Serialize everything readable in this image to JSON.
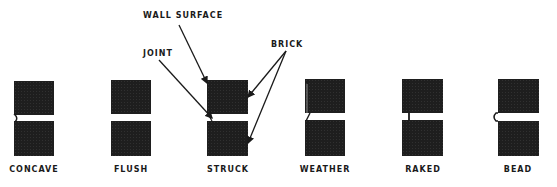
{
  "figure": {
    "callouts": {
      "wall_surface": "WALL SURFACE",
      "joint": "JOINT",
      "brick": "BRICK"
    },
    "joint_types": [
      {
        "id": "concave",
        "label": "CONCAVE",
        "x": 14,
        "width": 40,
        "feature": "concave-curve"
      },
      {
        "id": "flush",
        "label": "FLUSH",
        "x": 111,
        "width": 40,
        "feature": "flush"
      },
      {
        "id": "struck",
        "label": "STRUCK",
        "x": 207,
        "width": 41,
        "feature": "struck-slope"
      },
      {
        "id": "weather",
        "label": "WEATHER",
        "x": 305,
        "width": 40,
        "feature": "weather-slope"
      },
      {
        "id": "raked",
        "label": "RAKED",
        "x": 402,
        "width": 41,
        "feature": "raked-recess"
      },
      {
        "id": "bead",
        "label": "BEAD",
        "x": 498,
        "width": 41,
        "feature": "bead-protrusion"
      }
    ],
    "colors": {
      "brick": "#1e1e1e",
      "ink": "#1a1a1a",
      "background": "#ffffff"
    }
  }
}
